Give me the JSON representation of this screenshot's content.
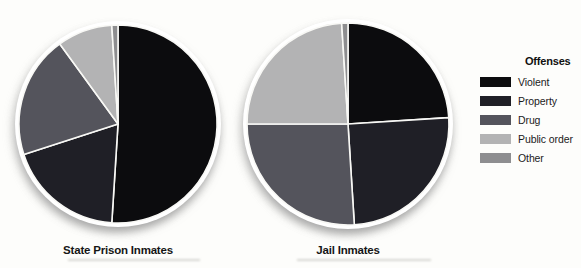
{
  "figure": {
    "kind": "dual pie chart figure, grayscale print style",
    "background_color": "#fdfdfb",
    "separator_color": "#f8f8f5"
  },
  "legend": {
    "title": "Offenses",
    "position": "right",
    "items": [
      {
        "label": "Violent",
        "color": "#0c0c0e"
      },
      {
        "label": "Property",
        "color": "#1f1f26"
      },
      {
        "label": "Drug",
        "color": "#54545c"
      },
      {
        "label": "Public order",
        "color": "#b3b3b4"
      },
      {
        "label": "Other",
        "color": "#8e8e90"
      }
    ]
  },
  "chart_data": [
    {
      "type": "pie",
      "title": "State Prison Inmates",
      "labels": [
        "Violent",
        "Property",
        "Drug",
        "Public order",
        "Other"
      ],
      "values": [
        51,
        19,
        20,
        9,
        1
      ],
      "unit": "percent of inmates (estimated from slice angles)",
      "colors": [
        "#0c0c0e",
        "#1f1f26",
        "#54545c",
        "#b3b3b4",
        "#8e8e90"
      ],
      "start_angle": "12 o'clock",
      "direction": "clockwise",
      "legend_title": "Offenses",
      "legend_position": "right"
    },
    {
      "type": "pie",
      "title": "Jail Inmates",
      "labels": [
        "Violent",
        "Property",
        "Drug",
        "Public order",
        "Other"
      ],
      "values": [
        24,
        25,
        26,
        24,
        1
      ],
      "unit": "percent of inmates (estimated from slice angles)",
      "colors": [
        "#0c0c0e",
        "#1f1f26",
        "#54545c",
        "#b3b3b4",
        "#8e8e90"
      ],
      "start_angle": "12 o'clock",
      "direction": "clockwise",
      "legend_title": "Offenses",
      "legend_position": "right"
    }
  ]
}
